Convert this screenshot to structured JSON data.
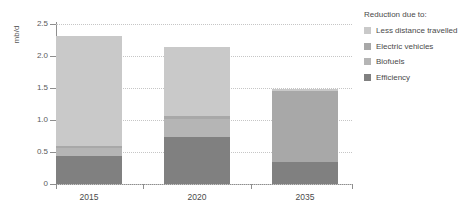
{
  "chart_data": {
    "type": "bar",
    "subtype": "stacked-bar",
    "title": "",
    "xlabel": "",
    "ylabel": "mb/d",
    "categories": [
      "2015",
      "2020",
      "2035"
    ],
    "ylim": [
      0,
      2.5
    ],
    "yticks": [
      0,
      0.5,
      1.0,
      1.5,
      2.0,
      2.5
    ],
    "ytick_labels": [
      "0",
      "0.5",
      "1.0",
      "1.5",
      "2.0",
      "2.5"
    ],
    "grid": true,
    "grid_axis": "y",
    "legend_title": "Reduction due to:",
    "legend_position": "right",
    "stack_order_bottom_to_top": [
      "Efficiency",
      "Biofuels",
      "Electric vehicles",
      "Less distance travelled"
    ],
    "series": [
      {
        "name": "Less distance travelled",
        "color": "#c9c9c9",
        "values": [
          1.72,
          1.08,
          0.03
        ]
      },
      {
        "name": "Electric vehicles",
        "color": "#a8a8a8",
        "values": [
          0.03,
          0.04,
          1.11
        ]
      },
      {
        "name": "Biofuels",
        "color": "#b5b5b5",
        "values": [
          0.14,
          0.28,
          0.0
        ]
      },
      {
        "name": "Efficiency",
        "color": "#808080",
        "values": [
          0.43,
          0.74,
          0.35
        ]
      }
    ],
    "totals": [
      2.32,
      2.14,
      1.49
    ]
  },
  "legend": {
    "title": "Reduction due to:",
    "items": [
      {
        "label": "Less distance travelled",
        "color": "#c9c9c9"
      },
      {
        "label": "Electric vehicles",
        "color": "#a8a8a8"
      },
      {
        "label": "Biofuels",
        "color": "#b5b5b5"
      },
      {
        "label": "Efficiency",
        "color": "#808080"
      }
    ]
  },
  "axes": {
    "y_label": "mb/d",
    "y_tick_labels": [
      "2.5",
      "2.0",
      "1.5",
      "1.0",
      "0.5",
      "0"
    ],
    "x_tick_labels": [
      "2015",
      "2020",
      "2035"
    ]
  },
  "colors": {
    "axis": "#8e8e8e",
    "grid": "#c6c6c6",
    "text": "#4a4a4a",
    "background": "#ffffff"
  }
}
